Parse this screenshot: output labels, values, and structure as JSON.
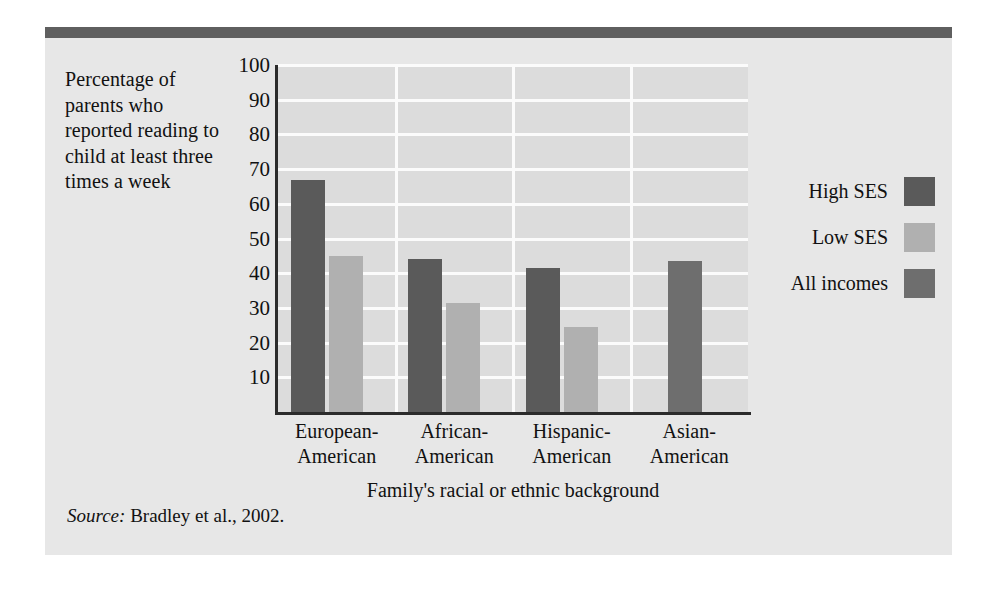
{
  "figure": {
    "y_axis_caption": "Percentage of parents who reported reading to child at least three times a week",
    "source_word": "Source:",
    "source_text": " Bradley et al., 2002.",
    "colors": {
      "panel_background": "#e7e7e7",
      "plot_background": "#dcdcdc",
      "gridline": "#fbfbfb",
      "axis": "#2b2b2b",
      "top_rule": "#5f5f5f",
      "high_ses": "#5a5a5a",
      "low_ses": "#b0b0b0",
      "all_incomes": "#6e6e6e",
      "text": "#111111"
    }
  },
  "legend": {
    "position": "right",
    "entries": [
      {
        "label": "High SES",
        "color": "#5a5a5a"
      },
      {
        "label": "Low SES",
        "color": "#b0b0b0"
      },
      {
        "label": "All incomes",
        "color": "#6e6e6e"
      }
    ]
  },
  "chart_data": {
    "type": "bar",
    "title": "",
    "subtitle": "",
    "xlabel": "Family's racial or ethnic background",
    "ylabel": "Percentage of parents who reported reading to child at least three times a week",
    "categories": [
      "European-\nAmerican",
      "African-\nAmerican",
      "Hispanic-\nAmerican",
      "Asian-\nAmerican"
    ],
    "category_lines": [
      [
        "European-",
        "American"
      ],
      [
        "African-",
        "American"
      ],
      [
        "Hispanic-",
        "American"
      ],
      [
        "Asian-",
        "American"
      ]
    ],
    "series": [
      {
        "name": "High SES",
        "color": "#5a5a5a",
        "values": [
          67,
          44,
          41.5,
          null
        ]
      },
      {
        "name": "Low SES",
        "color": "#b0b0b0",
        "values": [
          45,
          31.5,
          24.5,
          null
        ]
      },
      {
        "name": "All incomes",
        "color": "#6e6e6e",
        "values": [
          null,
          null,
          null,
          43.5
        ]
      }
    ],
    "ylim": [
      0,
      100
    ],
    "yticks": [
      10,
      20,
      30,
      40,
      50,
      60,
      70,
      80,
      90,
      100
    ],
    "ytick_labels": [
      "10",
      "20",
      "30",
      "40",
      "50",
      "60",
      "70",
      "80",
      "90",
      "100"
    ],
    "grid": {
      "horizontal": true,
      "vertical": true,
      "vertical_between_categories": true
    },
    "legend_position": "right",
    "annotations": [],
    "source": "Source: Bradley et al., 2002."
  }
}
